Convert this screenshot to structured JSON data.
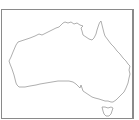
{
  "map": {
    "title": "Australia",
    "region": "Australia outline map",
    "colors": {
      "background": "#ffffff",
      "frame": "#8a8a8a",
      "coastline": "#9a9a9a"
    },
    "features": [
      {
        "name": "Australia mainland",
        "type": "landmass"
      },
      {
        "name": "Tasmania",
        "type": "island"
      }
    ]
  }
}
